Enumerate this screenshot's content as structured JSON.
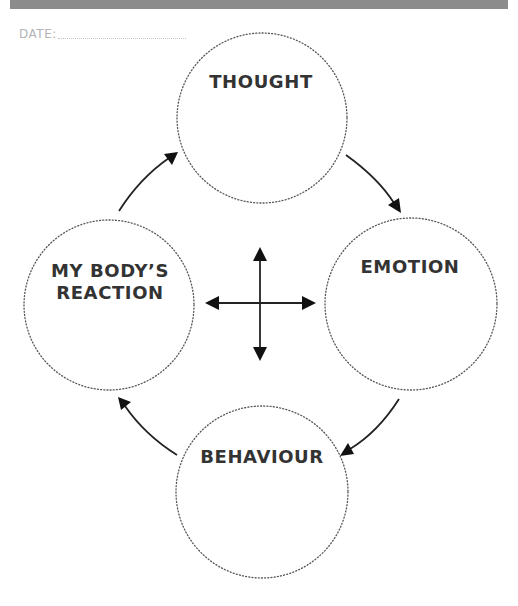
{
  "header": {
    "bar_color": "#8c8c8c"
  },
  "date": {
    "label": "DATE:",
    "value": ""
  },
  "diagram": {
    "type": "cycle",
    "nodes": [
      {
        "id": "thought",
        "lines": [
          "THOUGHT"
        ]
      },
      {
        "id": "emotion",
        "lines": [
          "EMOTION"
        ]
      },
      {
        "id": "behaviour",
        "lines": [
          "BEHAVIOUR"
        ]
      },
      {
        "id": "body-reaction",
        "lines": [
          "MY BODY’S",
          "REACTION"
        ]
      }
    ],
    "edges": [
      {
        "from": "thought",
        "to": "emotion"
      },
      {
        "from": "emotion",
        "to": "behaviour"
      },
      {
        "from": "behaviour",
        "to": "body-reaction"
      },
      {
        "from": "body-reaction",
        "to": "thought"
      }
    ],
    "center_symbol": "four-way-arrow",
    "colors": {
      "text": "#333333",
      "circle_stroke": "#555555",
      "arrow": "#111111"
    }
  }
}
